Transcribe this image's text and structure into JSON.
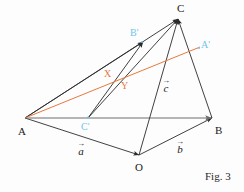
{
  "figure": {
    "caption": "Fig. 3",
    "background_color": "#fdfdfd",
    "line_color": "#2b2b2b",
    "accent_orange": "#e8793c",
    "accent_blue": "#6fc5e8",
    "width": 244,
    "height": 192
  },
  "vertices": {
    "C": {
      "label": "C",
      "x": 178,
      "y": 18,
      "label_x": 177,
      "label_y": 4,
      "color": "#1a1a1a"
    },
    "A": {
      "label": "A",
      "x": 25,
      "y": 118,
      "label_x": 18,
      "label_y": 127,
      "color": "#1a1a1a"
    },
    "B": {
      "label": "B",
      "x": 212,
      "y": 118,
      "label_x": 215,
      "label_y": 126,
      "color": "#1a1a1a"
    },
    "O": {
      "label": "O",
      "x": 139,
      "y": 155,
      "label_x": 135,
      "label_y": 163,
      "color": "#1a1a1a"
    }
  },
  "points": {
    "B_prime": {
      "label": "B'",
      "x": 142,
      "y": 42,
      "label_x": 131,
      "label_y": 29,
      "color": "#6fc5e8"
    },
    "A_prime": {
      "label": "A'",
      "x": 199,
      "y": 48,
      "label_x": 201,
      "label_y": 41,
      "color": "#6fc5e8"
    },
    "C_prime": {
      "label": "C'",
      "x": 88,
      "y": 117,
      "label_x": 82,
      "label_y": 123,
      "color": "#6fc5e8"
    },
    "X": {
      "label": "X",
      "x": 113,
      "y": 78,
      "label_x": 105,
      "label_y": 70,
      "color": "#e8793c"
    },
    "Y": {
      "label": "Y",
      "x": 127,
      "y": 87,
      "label_x": 122,
      "label_y": 82,
      "color": "#e8793c"
    }
  },
  "vectors": {
    "a": {
      "glyph": "a",
      "arrow": "→",
      "label_x": 78,
      "label_y": 143,
      "description": "vector a from A to O"
    },
    "b": {
      "glyph": "b",
      "arrow": "→",
      "label_x": 177,
      "label_y": 141,
      "description": "vector b from O to B"
    },
    "c": {
      "glyph": "c",
      "arrow": "→",
      "label_x": 163,
      "label_y": 80,
      "description": "vector c from O to C"
    }
  },
  "segments": [
    {
      "name": "A-B",
      "from": "A",
      "to": "B",
      "color": "#7a7a7a",
      "arrow": true
    },
    {
      "name": "A-O",
      "from": "A",
      "to": "O",
      "color": "#2b2b2b",
      "arrow": true
    },
    {
      "name": "O-B",
      "from": "O",
      "to": "B",
      "color": "#2b2b2b",
      "arrow": true
    },
    {
      "name": "O-C",
      "from": "O",
      "to": "C",
      "color": "#2b2b2b",
      "arrow": true
    },
    {
      "name": "A-C",
      "from": "A",
      "to": "C",
      "color": "#2b2b2b",
      "arrow": true
    },
    {
      "name": "B-C",
      "from": "B",
      "to": "C",
      "color": "#2b2b2b",
      "arrow": true
    },
    {
      "name": "A-Bprime-C",
      "from": "A",
      "to": "C",
      "color": "#2b2b2b",
      "arrow": true
    },
    {
      "name": "Cprime-C",
      "from": "C_prime",
      "to": "C",
      "color": "#2b2b2b",
      "arrow": true
    },
    {
      "name": "Cprime-Bprime",
      "from": "C_prime",
      "to": "B_prime",
      "color": "#2b2b2b",
      "arrow": true
    },
    {
      "name": "A-Aprime",
      "from": "A",
      "to": "A_prime",
      "color": "#e8793c",
      "arrow": false
    }
  ]
}
